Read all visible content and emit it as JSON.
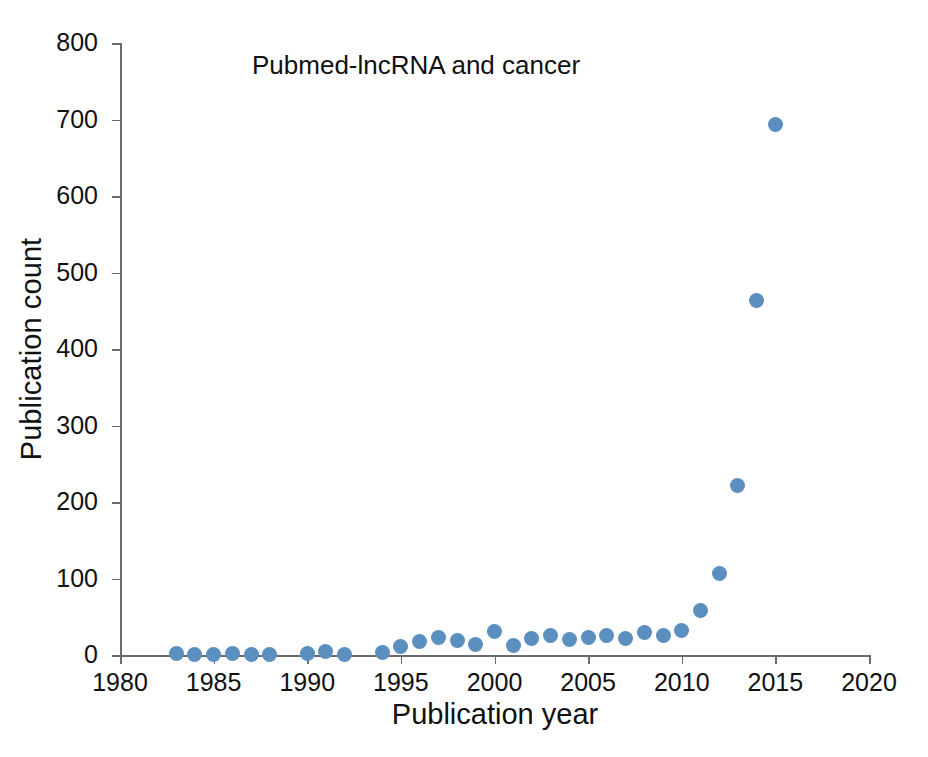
{
  "figure": {
    "background_color": "#ffffff"
  },
  "chart_data": {
    "type": "scatter",
    "title": "Pubmed-lncRNA and cancer",
    "xlabel": "Publication year",
    "ylabel": "Publication count",
    "xlim": [
      1980,
      2020
    ],
    "ylim": [
      0,
      800
    ],
    "xticks": [
      1980,
      1985,
      1990,
      1995,
      2000,
      2005,
      2010,
      2015,
      2020
    ],
    "yticks": [
      0,
      100,
      200,
      300,
      400,
      500,
      600,
      700,
      800
    ],
    "grid": false,
    "legend": "none",
    "marker": {
      "shape": "circle",
      "color": "#5b8fc0",
      "size_px": 15
    },
    "axis_color": "#6b6b6b",
    "x": [
      1983,
      1984,
      1985,
      1986,
      1987,
      1988,
      1990,
      1991,
      1992,
      1994,
      1995,
      1996,
      1997,
      1998,
      1999,
      2000,
      2001,
      2002,
      2003,
      2004,
      2005,
      2006,
      2007,
      2008,
      2009,
      2010,
      2011,
      2012,
      2013,
      2014,
      2015
    ],
    "values": [
      2,
      1,
      1,
      2,
      1,
      1,
      2,
      4,
      1,
      3,
      11,
      17,
      23,
      19,
      14,
      31,
      13,
      21,
      25,
      20,
      23,
      25,
      21,
      30,
      26,
      32,
      58,
      107,
      221,
      464,
      694
    ],
    "points": [
      {
        "year": 1983,
        "count": 2
      },
      {
        "year": 1984,
        "count": 1
      },
      {
        "year": 1985,
        "count": 1
      },
      {
        "year": 1986,
        "count": 2
      },
      {
        "year": 1987,
        "count": 1
      },
      {
        "year": 1988,
        "count": 1
      },
      {
        "year": 1990,
        "count": 2
      },
      {
        "year": 1991,
        "count": 4
      },
      {
        "year": 1992,
        "count": 1
      },
      {
        "year": 1994,
        "count": 3
      },
      {
        "year": 1995,
        "count": 11
      },
      {
        "year": 1996,
        "count": 17
      },
      {
        "year": 1997,
        "count": 23
      },
      {
        "year": 1998,
        "count": 19
      },
      {
        "year": 1999,
        "count": 14
      },
      {
        "year": 2000,
        "count": 31
      },
      {
        "year": 2001,
        "count": 13
      },
      {
        "year": 2002,
        "count": 21
      },
      {
        "year": 2003,
        "count": 25
      },
      {
        "year": 2004,
        "count": 20
      },
      {
        "year": 2005,
        "count": 23
      },
      {
        "year": 2006,
        "count": 25
      },
      {
        "year": 2007,
        "count": 21
      },
      {
        "year": 2008,
        "count": 30
      },
      {
        "year": 2009,
        "count": 26
      },
      {
        "year": 2010,
        "count": 32
      },
      {
        "year": 2011,
        "count": 58
      },
      {
        "year": 2012,
        "count": 107
      },
      {
        "year": 2013,
        "count": 221
      },
      {
        "year": 2014,
        "count": 464
      },
      {
        "year": 2015,
        "count": 694
      }
    ]
  }
}
